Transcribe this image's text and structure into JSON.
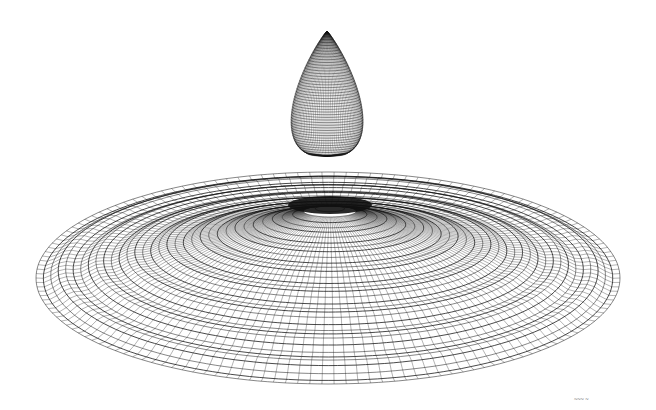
{
  "artwork": {
    "subject": "Water drop falling above concentric ripple surface, wireframe mesh",
    "drop": {
      "cx": 327,
      "tip_y": 31,
      "bottom_y": 156,
      "half_width": 59,
      "rings": 48,
      "meridians": 56
    },
    "surface": {
      "cx": 328,
      "cy": 278,
      "rx": 292,
      "ry": 106,
      "ripple_center_x": 330,
      "ripple_center_y": 205,
      "rings": 34,
      "spokes": 150
    },
    "colors": {
      "background": "#ffffff",
      "line": "#111111"
    }
  },
  "signature": {
    "text": "signature"
  }
}
